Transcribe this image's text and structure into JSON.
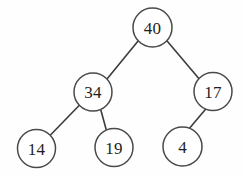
{
  "figure": {
    "type": "binary-tree-diagram",
    "background_color": "#fefefe",
    "node_fill": "#ffffff",
    "node_stroke": "#4a4a4a",
    "edge_color": "#3c3c3c",
    "label_color": "#1e1e1e",
    "width": 243,
    "height": 177
  },
  "tree": {
    "nodes": [
      {
        "id": "n40",
        "label": "40",
        "cx": 152.5,
        "cy": 27.5,
        "r": 19.5,
        "level": 0
      },
      {
        "id": "n34",
        "label": "34",
        "cx": 93.0,
        "cy": 92.0,
        "r": 19.0,
        "level": 1
      },
      {
        "id": "n17",
        "label": "17",
        "cx": 213.0,
        "cy": 91.5,
        "r": 19.0,
        "level": 1
      },
      {
        "id": "n14",
        "label": "14",
        "cx": 36.5,
        "cy": 148.5,
        "r": 19.0,
        "level": 2
      },
      {
        "id": "n19",
        "label": "19",
        "cx": 114.0,
        "cy": 147.5,
        "r": 19.0,
        "level": 2
      },
      {
        "id": "n4",
        "label": "4",
        "cx": 182.5,
        "cy": 146.5,
        "r": 19.5,
        "level": 2
      }
    ],
    "edges": [
      {
        "from": "n40",
        "to": "n34",
        "side": "left",
        "x1": 138.3,
        "y1": 40.8,
        "x2": 107.2,
        "y2": 78.7
      },
      {
        "from": "n40",
        "to": "n17",
        "side": "right",
        "x1": 166.9,
        "y1": 40.7,
        "x2": 198.6,
        "y2": 78.3
      },
      {
        "from": "n34",
        "to": "n14",
        "side": "left",
        "x1": 79.6,
        "y1": 105.0,
        "x2": 50.0,
        "y2": 135.5
      },
      {
        "from": "n34",
        "to": "n19",
        "side": "right",
        "x1": 100.9,
        "y1": 110.3,
        "x2": 106.1,
        "y2": 129.2
      },
      {
        "from": "n17",
        "to": "n4",
        "side": "left",
        "x1": 205.8,
        "y1": 109.1,
        "x2": 189.7,
        "y2": 128.0
      }
    ]
  }
}
